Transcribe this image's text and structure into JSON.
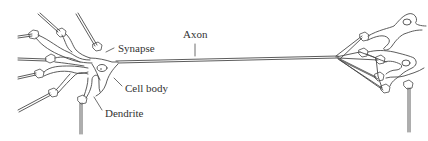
{
  "diagram": {
    "labels": {
      "synapse": "Synapse",
      "axon": "Axon",
      "cell_body": "Cell body",
      "dendrite": "Dendrite"
    },
    "colors": {
      "stroke": "#4a4a4a",
      "text": "#333333",
      "background": "#ffffff"
    }
  }
}
